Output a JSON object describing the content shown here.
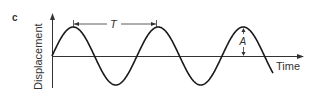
{
  "figure": {
    "panel_label": "c",
    "y_axis_label": "Displacement",
    "x_axis_label": "Time",
    "period_label": "T",
    "amplitude_label": "A"
  },
  "waveform": {
    "type": "sine",
    "cycles_shown": 2.6,
    "color": "#1a1a1a"
  }
}
